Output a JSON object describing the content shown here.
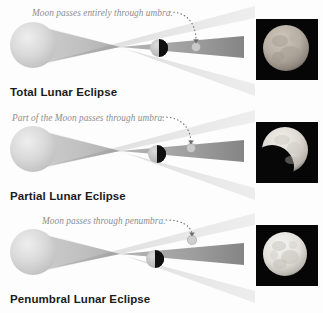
{
  "figure": {
    "title_semantic": "Types of Lunar Eclipses diagram",
    "background_color": "#fdfdfd",
    "text_color_caption": "#1b1b1b",
    "text_color_annotation": "#8d8d8d",
    "photo_background": "#050505"
  },
  "panels": [
    {
      "id": "total",
      "caption": "Total Lunar Eclipse",
      "annotation": "Moon passes entirely through umbra.",
      "photo_alt": "Total lunar eclipse photograph of a dimmed reddish-gray full Moon",
      "moon_in_umbra": "entirely",
      "small_moon_label": "moon-marker-in-umbra"
    },
    {
      "id": "partial",
      "caption": "Partial Lunar Eclipse",
      "annotation": "Part of the Moon passes through umbra.",
      "photo_alt": "Partial lunar eclipse photograph with a dark bite on the lower left of the Moon",
      "moon_in_umbra": "partially",
      "small_moon_label": "moon-marker-edge-of-umbra"
    },
    {
      "id": "penumbral",
      "caption": "Penumbral Lunar Eclipse",
      "annotation": "Moon passes through penumbra.",
      "photo_alt": "Penumbral lunar eclipse photograph of a bright full Moon with visible maria",
      "moon_in_umbra": "not at all",
      "small_moon_label": "moon-marker-in-penumbra"
    }
  ],
  "legend_semantics": {
    "earth_label": "Earth",
    "umbra_label": "umbra",
    "penumbra_label": "penumbra",
    "moon_label": "Moon"
  },
  "colors": {
    "earth_light": "#e8e8e8",
    "earth_mid": "#cfcfcf",
    "earth_dark": "#bcbcbc",
    "penumbra": "#dcdcdc",
    "umbra": "#9a9a9a",
    "umbra_dark": "#7d7d7d",
    "moon_lit": "#cccccc",
    "moon_shadow": "#141414",
    "dot_arrow": "#6e6e6e"
  }
}
